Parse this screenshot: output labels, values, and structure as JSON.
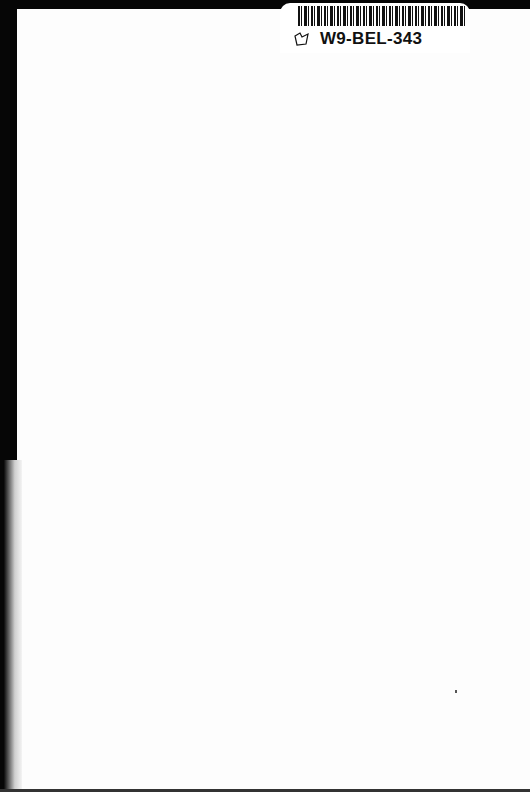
{
  "document": {
    "type": "scanned-blank-page",
    "label": {
      "barcode_text": "W9-BEL-343",
      "icon": "book-icon"
    },
    "colors": {
      "background": "#060606",
      "page": "#fdfdfd",
      "ink": "#111111"
    }
  }
}
